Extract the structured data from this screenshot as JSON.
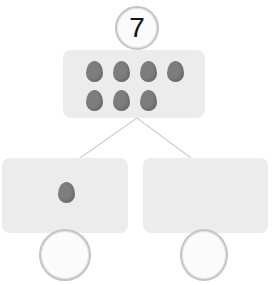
{
  "diagram": {
    "type": "number-bond",
    "whole": {
      "value": "7",
      "egg_count": 7,
      "egg_rows": [
        4,
        3
      ]
    },
    "parts": [
      {
        "position": "left",
        "egg_count": 1,
        "value": ""
      },
      {
        "position": "right",
        "egg_count": 0,
        "value": ""
      }
    ],
    "colors": {
      "box": "#ececec",
      "egg": "#7d7d7d",
      "ring": "#c4c4c4",
      "line": "#cfcfcf"
    }
  }
}
